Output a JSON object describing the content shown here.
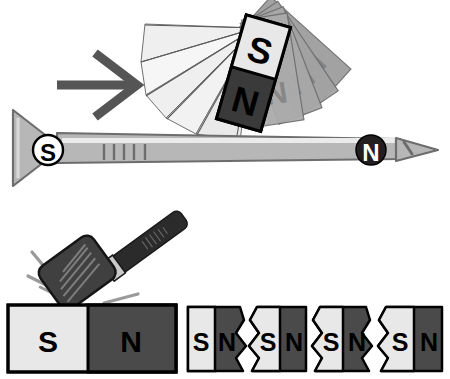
{
  "figure": {
    "type": "science-illustration",
    "background": "#ffffff"
  },
  "palette": {
    "black": "#000000",
    "white": "#ffffff",
    "light_gray": "#e8e8e8",
    "pale_gray": "#efefef",
    "mid_gray": "#a0a0a0",
    "ghost_gray": "#9e9e9e",
    "ghost_gray_dark": "#8a8a8a",
    "dark_gray": "#4a4a4a",
    "darker_gray": "#3a3a3a",
    "nail_body": "#b7b7b7",
    "nail_highlight": "#e6e6e6",
    "nail_outline": "#6d6d6d",
    "arrow_gray": "#555555",
    "spark_gray": "#9a9a9a",
    "hammer_head": "#404040",
    "hammer_handle": "#2b2b2b",
    "ferrule": "#c9c9c9"
  },
  "panels": {
    "top": {
      "name": "stroking-a-nail-with-a-magnet",
      "arrow": {
        "label": "motion-direction-arrow",
        "direction": "right"
      },
      "magnet": {
        "label": "bar-magnet-tilted",
        "rotation_deg": 16,
        "poles": [
          {
            "label": "S",
            "fill": "#e8e8e8",
            "text_color": "#000000"
          },
          {
            "label": "N",
            "fill": "#3a3a3a",
            "text_color": "#000000"
          }
        ]
      },
      "motion_ghosts": {
        "label": "motion-blur-ghost-copies",
        "count": 4,
        "fill": "#9e9e9e",
        "sweep_fill": "#efefef"
      },
      "nail": {
        "label": "iron-nail",
        "head_pole": "S",
        "tip_pole": "N",
        "head_pole_style": "white-circle-black-letter",
        "tip_pole_style": "black-circle-white-letter",
        "hatch_marks": 5
      }
    },
    "bottom": {
      "name": "breaking-a-magnet-makes-smaller-magnets",
      "hammer": {
        "label": "hammer",
        "head_fill": "#404040",
        "handle_fill": "#2b2b2b"
      },
      "impact_lines": {
        "label": "impact-spark-lines",
        "count": 4
      },
      "whole_magnet": {
        "label": "whole-bar-magnet",
        "poles": [
          {
            "label": "S",
            "fill": "#e8e8e8"
          },
          {
            "label": "N",
            "fill": "#4a4a4a"
          }
        ]
      },
      "broken_pieces": {
        "label": "broken-magnet-fragments",
        "count": 4,
        "pieces": [
          {
            "left": "S",
            "right": "N"
          },
          {
            "left": "S",
            "right": "N"
          },
          {
            "left": "S",
            "right": "N"
          },
          {
            "left": "S",
            "right": "N"
          }
        ]
      }
    }
  }
}
